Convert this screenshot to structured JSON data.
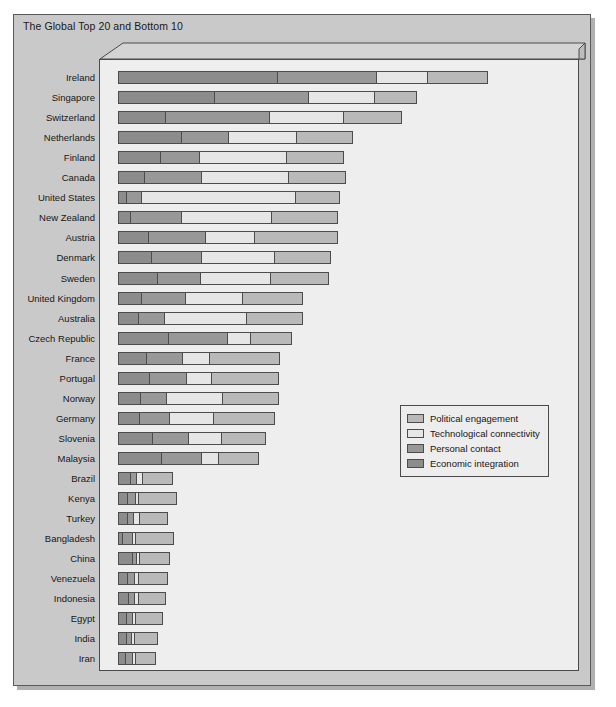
{
  "chart_title": "The Global Top 20 and Bottom 10",
  "legend": {
    "position": "middle-right",
    "items": [
      {
        "label": "Political engagement",
        "color": "#b9b9b9",
        "key": "political"
      },
      {
        "label": "Technological connectivity",
        "color": "#e6e6e6",
        "key": "technological"
      },
      {
        "label": "Personal contact",
        "color": "#989898",
        "key": "personal"
      },
      {
        "label": "Economic integration",
        "color": "#8c8c8c",
        "key": "economic"
      }
    ]
  },
  "chart_data": {
    "type": "bar",
    "orientation": "horizontal",
    "stacked": true,
    "title": "The Global Top 20 and Bottom 10",
    "xlabel": "",
    "ylabel": "",
    "grid": false,
    "legend_position": "middle-right",
    "xlim": [
      0,
      100
    ],
    "segment_order": [
      "economic",
      "personal",
      "technological",
      "political"
    ],
    "series": [
      {
        "name": "Economic integration",
        "color": "#8c8c8c",
        "values": [
          34.5,
          20.9,
          10.2,
          13.6,
          9.1,
          5.5,
          1.5,
          2.4,
          6.3,
          7.0,
          8.3,
          4.8,
          4.3,
          10.8,
          6.1,
          6.6,
          4.6,
          4.4,
          7.4,
          9.4,
          2.7,
          2.0,
          1.9,
          0.8,
          3.1,
          2.0,
          2.2,
          1.8,
          1.8,
          1.6
        ]
      },
      {
        "name": "Personal contact",
        "color": "#989898",
        "values": [
          21.6,
          20.3,
          22.5,
          10.2,
          8.4,
          12.4,
          3.2,
          11.0,
          12.4,
          11.0,
          9.5,
          9.7,
          5.4,
          12.9,
          7.8,
          8.0,
          5.7,
          6.5,
          7.8,
          8.7,
          1.1,
          1.5,
          1.1,
          2.0,
          0.6,
          1.3,
          1.1,
          1.1,
          0.9,
          1.3
        ]
      },
      {
        "name": "Technological connectivity",
        "color": "#e6e6e6",
        "values": [
          10.8,
          14.3,
          16.2,
          14.9,
          19.0,
          19.0,
          33.7,
          19.7,
          10.8,
          15.8,
          15.1,
          12.3,
          18.1,
          5.0,
          5.8,
          5.4,
          12.3,
          9.7,
          7.1,
          3.7,
          8.0,
          9.2,
          7.8,
          9.3,
          7.6,
          7.6,
          7.1,
          6.9,
          6.0,
          5.4
        ]
      },
      {
        "name": "Political engagement",
        "color": "#b9b9b9",
        "values": [
          13.0,
          9.1,
          12.5,
          12.1,
          12.3,
          12.3,
          9.5,
          14.5,
          18.1,
          12.3,
          12.7,
          13.2,
          12.1,
          8.8,
          15.3,
          14.7,
          12.1,
          13.4,
          9.7,
          8.7,
          0.0,
          0.0,
          0.0,
          0.0,
          0.0,
          0.0,
          0.0,
          0.0,
          0.0,
          0.0
        ]
      }
    ],
    "categories": [
      "Ireland",
      "Singapore",
      "Switzerland",
      "Netherlands",
      "Finland",
      "Canada",
      "United States",
      "New Zealand",
      "Austria",
      "Denmark",
      "Sweden",
      "United Kingdom",
      "Australia",
      "Czech Republic",
      "France",
      "Portugal",
      "Norway",
      "Germany",
      "Slovenia",
      "Malaysia",
      "Brazil",
      "Kenya",
      "Turkey",
      "Bangladesh",
      "China",
      "Venezuela",
      "Indonesia",
      "Egypt",
      "India",
      "Iran"
    ],
    "totals": [
      79.9,
      64.6,
      61.4,
      50.8,
      48.8,
      49.2,
      47.9,
      47.6,
      47.6,
      46.1,
      45.6,
      40.0,
      39.9,
      37.5,
      35.0,
      34.7,
      34.7,
      34.0,
      32.0,
      30.5,
      11.8,
      12.7,
      10.8,
      12.1,
      11.3,
      10.9,
      10.4,
      9.8,
      8.7,
      8.3
    ]
  },
  "rows": [
    {
      "label": "Ireland",
      "economic": 34.5,
      "personal": 21.6,
      "technological": 10.8,
      "political": 13.0
    },
    {
      "label": "Singapore",
      "economic": 20.9,
      "personal": 20.3,
      "technological": 14.3,
      "political": 9.1
    },
    {
      "label": "Switzerland",
      "economic": 10.2,
      "personal": 22.5,
      "technological": 16.2,
      "political": 12.5
    },
    {
      "label": "Netherlands",
      "economic": 13.6,
      "personal": 10.2,
      "technological": 14.9,
      "political": 12.1
    },
    {
      "label": "Finland",
      "economic": 9.1,
      "personal": 8.4,
      "technological": 19.0,
      "political": 12.3
    },
    {
      "label": "Canada",
      "economic": 5.5,
      "personal": 12.4,
      "technological": 19.0,
      "political": 12.3
    },
    {
      "label": "United States",
      "economic": 1.5,
      "personal": 3.2,
      "technological": 33.7,
      "political": 9.5
    },
    {
      "label": "New Zealand",
      "economic": 2.4,
      "personal": 11.0,
      "technological": 19.7,
      "political": 14.5
    },
    {
      "label": "Austria",
      "economic": 6.3,
      "personal": 12.4,
      "technological": 10.8,
      "political": 18.1
    },
    {
      "label": "Denmark",
      "economic": 7.0,
      "personal": 11.0,
      "technological": 15.8,
      "political": 12.3
    },
    {
      "label": "Sweden",
      "economic": 8.3,
      "personal": 9.5,
      "technological": 15.1,
      "political": 12.7
    },
    {
      "label": "United Kingdom",
      "economic": 4.8,
      "personal": 9.7,
      "technological": 12.3,
      "political": 13.2
    },
    {
      "label": "Australia",
      "economic": 4.3,
      "personal": 5.4,
      "technological": 18.1,
      "political": 12.1
    },
    {
      "label": "Czech Republic",
      "economic": 10.8,
      "personal": 12.9,
      "technological": 5.0,
      "political": 8.8
    },
    {
      "label": "France",
      "economic": 6.1,
      "personal": 7.8,
      "technological": 5.8,
      "political": 15.3
    },
    {
      "label": "Portugal",
      "economic": 6.6,
      "personal": 8.0,
      "technological": 5.4,
      "political": 14.7
    },
    {
      "label": "Norway",
      "economic": 4.6,
      "personal": 5.7,
      "technological": 12.3,
      "political": 12.1
    },
    {
      "label": "Germany",
      "economic": 4.4,
      "personal": 6.5,
      "technological": 9.7,
      "political": 13.4
    },
    {
      "label": "Slovenia",
      "economic": 7.4,
      "personal": 7.8,
      "technological": 7.1,
      "political": 9.7
    },
    {
      "label": "Malaysia",
      "economic": 9.4,
      "personal": 8.7,
      "technological": 3.7,
      "political": 8.7
    },
    {
      "label": "Brazil",
      "economic": 2.7,
      "personal": 1.1,
      "technological": 1.1,
      "political": 6.9
    },
    {
      "label": "Kenya",
      "economic": 2.0,
      "personal": 1.5,
      "technological": 0.6,
      "political": 8.6
    },
    {
      "label": "Turkey",
      "economic": 1.9,
      "personal": 1.1,
      "technological": 1.3,
      "political": 6.5
    },
    {
      "label": "Bangladesh",
      "economic": 0.8,
      "personal": 2.0,
      "technological": 0.4,
      "political": 8.9
    },
    {
      "label": "China",
      "economic": 3.1,
      "personal": 0.6,
      "technological": 0.7,
      "political": 6.9
    },
    {
      "label": "Venezuela",
      "economic": 2.0,
      "personal": 1.3,
      "technological": 0.7,
      "political": 6.9
    },
    {
      "label": "Indonesia",
      "economic": 2.2,
      "personal": 1.1,
      "technological": 0.7,
      "political": 6.4
    },
    {
      "label": "Egypt",
      "economic": 1.8,
      "personal": 1.1,
      "technological": 0.6,
      "political": 6.3
    },
    {
      "label": "India",
      "economic": 1.8,
      "personal": 0.9,
      "technological": 0.6,
      "political": 5.4
    },
    {
      "label": "Iran",
      "economic": 1.6,
      "personal": 1.3,
      "technological": 0.7,
      "political": 4.7
    }
  ]
}
